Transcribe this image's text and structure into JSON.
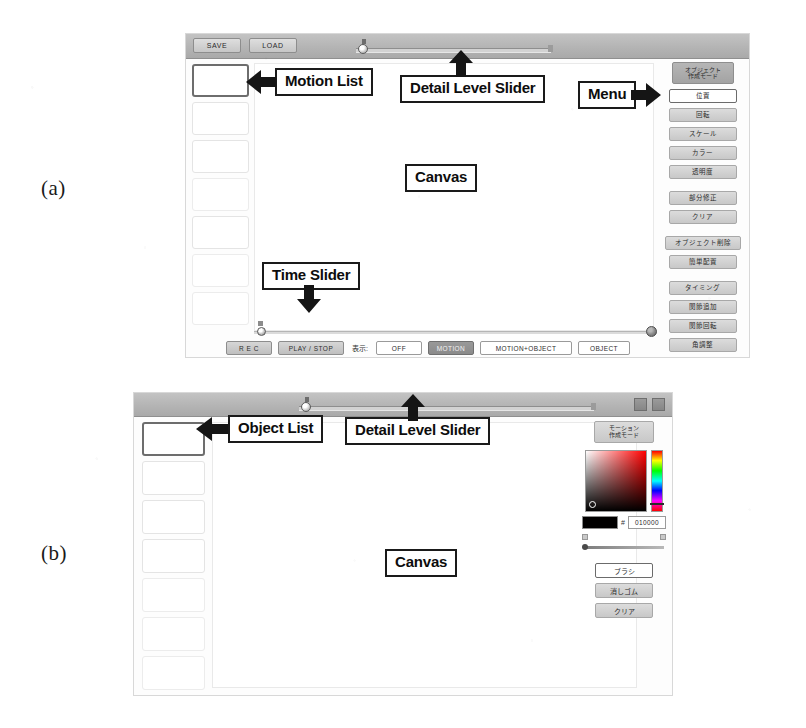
{
  "figure": {
    "markers": {
      "a": "(a)",
      "b": "(b)"
    }
  },
  "panel_a": {
    "titlebar": {
      "save_label": "SAVE",
      "load_label": "LOAD"
    },
    "motion_list": {
      "slots": [
        {
          "selected": true
        },
        {
          "selected": false
        },
        {
          "selected": false
        },
        {
          "selected": false
        },
        {
          "selected": false
        },
        {
          "selected": false
        },
        {
          "selected": false
        }
      ]
    },
    "transport": {
      "rec_label": "R E C",
      "play_stop_label": "PLAY / STOP",
      "display_label": "表示:",
      "toggles": [
        {
          "label": "OFF",
          "active": false
        },
        {
          "label": "MOTION",
          "active": true
        },
        {
          "label": "MOTION+OBJECT",
          "active": false
        },
        {
          "label": "OBJECT",
          "active": false
        }
      ]
    },
    "menu": {
      "mode_line1": "オブジェクト",
      "mode_line2": "作成モード",
      "groups": [
        [
          {
            "label": "位置",
            "selected": true
          },
          {
            "label": "回転",
            "selected": false
          },
          {
            "label": "スケール",
            "selected": false
          },
          {
            "label": "カラー",
            "selected": false
          },
          {
            "label": "透明度",
            "selected": false
          }
        ],
        [
          {
            "label": "部分修正",
            "selected": false
          },
          {
            "label": "クリア",
            "selected": false
          }
        ],
        [
          {
            "label": "オブジェクト削除",
            "selected": false,
            "wide": true
          },
          {
            "label": "簡単配置",
            "selected": false
          }
        ],
        [
          {
            "label": "タイミング",
            "selected": false
          },
          {
            "label": "関節追加",
            "selected": false
          },
          {
            "label": "関節回転",
            "selected": false
          },
          {
            "label": "角調整",
            "selected": false
          }
        ]
      ]
    }
  },
  "panel_b": {
    "object_list": {
      "slots": [
        {
          "selected": true
        },
        {
          "selected": false
        },
        {
          "selected": false
        },
        {
          "selected": false
        },
        {
          "selected": false
        },
        {
          "selected": false
        },
        {
          "selected": false
        }
      ]
    },
    "tools": {
      "mode_line1": "モーション",
      "mode_line2": "作成モード",
      "color_hash": "#",
      "color_hex": "010000",
      "buttons": [
        {
          "label": "ブラシ",
          "selected": true
        },
        {
          "label": "消しゴム",
          "selected": false
        },
        {
          "label": "クリア",
          "selected": false
        }
      ]
    }
  },
  "annotations": {
    "motion_list": "Motion List",
    "detail_level_slider_a": "Detail Level Slider",
    "menu": "Menu",
    "canvas_a": "Canvas",
    "time_slider": "Time Slider",
    "object_list": "Object List",
    "detail_level_slider_b": "Detail Level Slider",
    "canvas_b": "Canvas"
  }
}
